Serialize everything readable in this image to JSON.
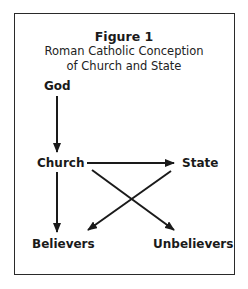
{
  "figure": {
    "number": "Figure 1",
    "title_line1": "Roman Catholic Conception",
    "title_line2": "of Church and State"
  },
  "nodes": {
    "god": "God",
    "church": "Church",
    "state": "State",
    "believers": "Believers",
    "unbelievers": "Unbelievers"
  },
  "edges": [
    {
      "from": "God",
      "to": "Church"
    },
    {
      "from": "Church",
      "to": "State"
    },
    {
      "from": "Church",
      "to": "Believers"
    },
    {
      "from": "Church",
      "to": "Unbelievers"
    },
    {
      "from": "State",
      "to": "Believers"
    }
  ],
  "colors": {
    "stroke": "#1a1a1a",
    "background": "#ffffff"
  }
}
